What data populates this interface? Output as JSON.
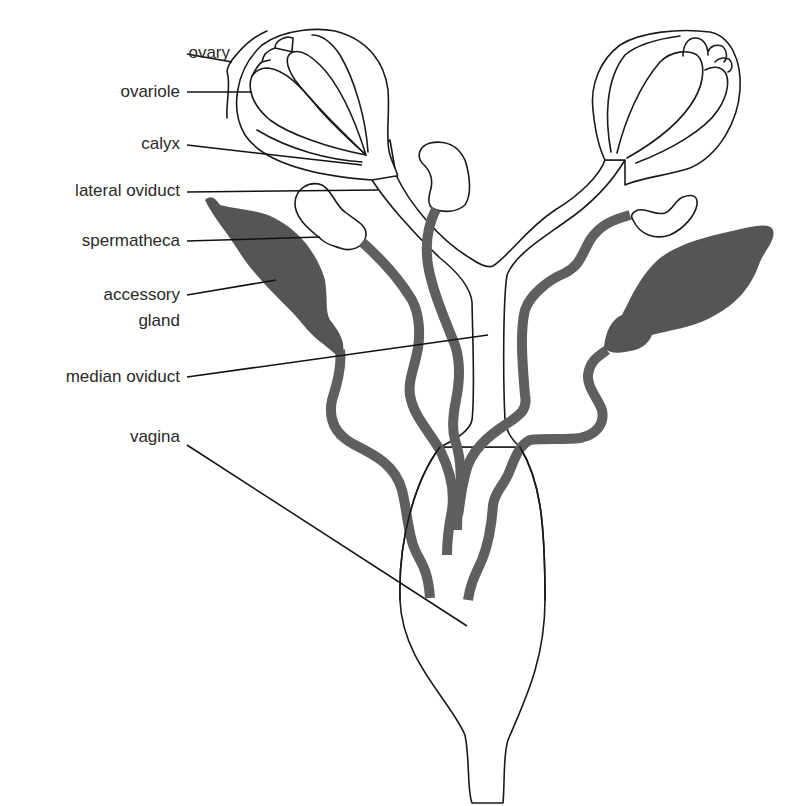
{
  "diagram": {
    "colors": {
      "outline": "#1a1a1a",
      "duct_fill": "#5f5f5f",
      "gland_fill": "#555555",
      "background": "#ffffff",
      "label_text": "#2a2a2a"
    },
    "labels": [
      {
        "id": "ovary",
        "text": "ovary",
        "x": 230,
        "y": 50
      },
      {
        "id": "ovariole",
        "text": "ovariole",
        "x": 180,
        "y": 93
      },
      {
        "id": "calyx",
        "text": "calyx",
        "x": 180,
        "y": 145
      },
      {
        "id": "lateral-oviduct",
        "text": "lateral oviduct",
        "x": 180,
        "y": 192
      },
      {
        "id": "spermatheca",
        "text": "spermatheca",
        "x": 180,
        "y": 241
      },
      {
        "id": "accessory-gland-1",
        "text": "accessory",
        "x": 180,
        "y": 294
      },
      {
        "id": "accessory-gland-2",
        "text": "gland",
        "x": 180,
        "y": 320
      },
      {
        "id": "median-oviduct",
        "text": "median oviduct",
        "x": 180,
        "y": 377
      },
      {
        "id": "vagina",
        "text": "vagina",
        "x": 180,
        "y": 437
      }
    ]
  }
}
